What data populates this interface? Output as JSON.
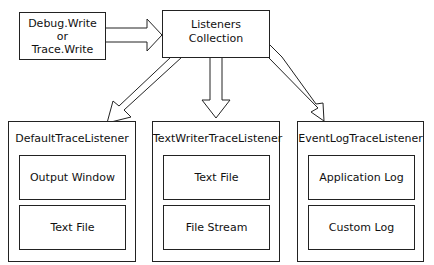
{
  "diagram": {
    "source": {
      "lines": [
        "Debug.Write",
        "or",
        "Trace.Write"
      ]
    },
    "collection": {
      "lines": [
        "Listeners",
        "Collection"
      ]
    },
    "listeners": [
      {
        "title": "DefaultTraceListener",
        "outputs": [
          "Output Window",
          "Text File"
        ]
      },
      {
        "title": "TextWriterTraceListener",
        "outputs": [
          "Text File",
          "File Stream"
        ]
      },
      {
        "title": "EventLogTraceListener",
        "outputs": [
          "Application Log",
          "Custom Log"
        ]
      }
    ],
    "edges": [
      {
        "from": "source",
        "to": "collection"
      },
      {
        "from": "collection",
        "to": "listeners.0"
      },
      {
        "from": "collection",
        "to": "listeners.1"
      },
      {
        "from": "collection",
        "to": "listeners.2"
      }
    ]
  }
}
